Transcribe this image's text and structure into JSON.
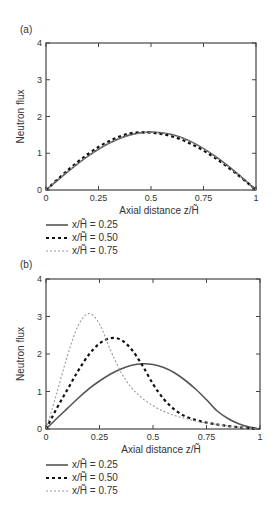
{
  "chart_data": [
    {
      "panel": "(a)",
      "type": "line",
      "xlabel": "Axial distance z/H̃",
      "ylabel": "Neutron flux",
      "xlim": [
        0,
        1
      ],
      "ylim": [
        0,
        4
      ],
      "xticks": [
        "0",
        "0.25",
        "0.5",
        "0.75",
        "1"
      ],
      "yticks": [
        "0",
        "1",
        "2",
        "3",
        "4"
      ],
      "grid": false,
      "legend_position": "below",
      "x": [
        0,
        0.1,
        0.2,
        0.3,
        0.4,
        0.5,
        0.6,
        0.7,
        0.8,
        0.9,
        1.0
      ],
      "series": [
        {
          "name": "x/H̃ = 0.25",
          "style": "solid",
          "color": "#555555",
          "values": [
            0,
            0.48,
            0.92,
            1.27,
            1.5,
            1.58,
            1.51,
            1.29,
            0.94,
            0.5,
            0
          ]
        },
        {
          "name": "x/H̃ = 0.50",
          "style": "dashed",
          "color": "#111111",
          "values": [
            0,
            0.52,
            0.98,
            1.33,
            1.54,
            1.56,
            1.46,
            1.23,
            0.89,
            0.47,
            0
          ]
        },
        {
          "name": "x/H̃ = 0.75",
          "style": "dotted",
          "color": "#999999",
          "values": [
            0,
            0.49,
            0.93,
            1.28,
            1.5,
            1.57,
            1.5,
            1.28,
            0.93,
            0.49,
            0
          ]
        }
      ]
    },
    {
      "panel": "(b)",
      "type": "line",
      "xlabel": "Axial distance z/H̃",
      "ylabel": "Neutron flux",
      "xlim": [
        0,
        1
      ],
      "ylim": [
        0,
        4
      ],
      "xticks": [
        "0",
        "0.25",
        "0.5",
        "0.75",
        "1"
      ],
      "yticks": [
        "0",
        "1",
        "2",
        "3",
        "4"
      ],
      "grid": false,
      "legend_position": "below",
      "x": [
        0,
        0.05,
        0.1,
        0.15,
        0.2,
        0.25,
        0.3,
        0.35,
        0.4,
        0.45,
        0.5,
        0.55,
        0.6,
        0.65,
        0.7,
        0.75,
        0.8,
        0.85,
        0.9,
        0.95,
        1.0
      ],
      "series": [
        {
          "name": "x/H̃ = 0.25",
          "style": "solid",
          "color": "#555555",
          "values": [
            0,
            0.28,
            0.55,
            0.82,
            1.07,
            1.28,
            1.46,
            1.6,
            1.7,
            1.74,
            1.72,
            1.64,
            1.5,
            1.3,
            1.06,
            0.78,
            0.48,
            0.28,
            0.14,
            0.05,
            0
          ]
        },
        {
          "name": "x/H̃ = 0.50",
          "style": "dashed",
          "color": "#111111",
          "values": [
            0,
            0.55,
            1.05,
            1.55,
            1.98,
            2.28,
            2.42,
            2.38,
            2.12,
            1.7,
            1.2,
            0.8,
            0.52,
            0.34,
            0.24,
            0.17,
            0.12,
            0.08,
            0.05,
            0.02,
            0
          ]
        },
        {
          "name": "x/H̃ = 0.75",
          "style": "dotted",
          "color": "#999999",
          "values": [
            0,
            0.95,
            1.95,
            2.75,
            3.08,
            2.8,
            2.12,
            1.52,
            1.1,
            0.82,
            0.62,
            0.47,
            0.36,
            0.28,
            0.21,
            0.16,
            0.12,
            0.08,
            0.05,
            0.02,
            0
          ]
        }
      ]
    }
  ],
  "panels": {
    "a": {
      "label": "(a)"
    },
    "b": {
      "label": "(b)"
    }
  },
  "legend": {
    "items": [
      {
        "label": "x/H̃ = 0.25"
      },
      {
        "label": "x/H̃ = 0.50"
      },
      {
        "label": "x/H̃ = 0.75"
      }
    ]
  }
}
